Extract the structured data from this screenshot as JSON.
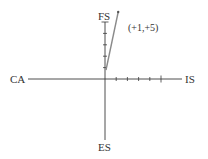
{
  "diagram": {
    "axes": {
      "left_label": "CA",
      "right_label": "IS",
      "top_label": "FS",
      "bottom_label": "ES"
    },
    "x_ticks": 5,
    "y_ticks": 5,
    "vector": {
      "dx": 1,
      "dy": 5,
      "label": "(+1,+5)"
    },
    "colors": {
      "axis": "#3a3a3a",
      "vector": "#8a8a8a",
      "text": "#333333"
    }
  }
}
